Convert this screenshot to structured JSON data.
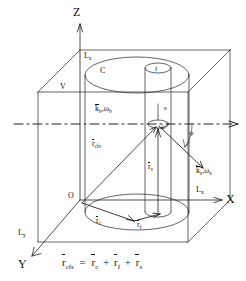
{
  "diagram": {
    "title_equation": {
      "lhs_symbol": "r",
      "lhs_sub": "cfs",
      "equals": "=",
      "term1_symbol": "r",
      "term1_sub": "c",
      "plus1": "+",
      "term2_symbol": "r",
      "term2_sub": "f",
      "plus2": "+",
      "term3_symbol": "r",
      "term3_sub": "s",
      "full_text": "r_cfs = r_c + r_f + r_s"
    },
    "axes": [
      {
        "name": "z-axis",
        "label": "Z"
      },
      {
        "name": "x-axis",
        "label": "X"
      },
      {
        "name": "y-axis",
        "label": "Y"
      }
    ],
    "dimensions": [
      {
        "name": "box-height",
        "symbol": "L",
        "sub": "z"
      },
      {
        "name": "box-width-x",
        "symbol": "L",
        "sub": "x"
      },
      {
        "name": "box-depth-y",
        "symbol": "L",
        "sub": "y"
      }
    ],
    "regions": [
      {
        "name": "volume",
        "label": "V"
      },
      {
        "name": "large-cylinder",
        "label": "C"
      },
      {
        "name": "small-cylinder",
        "label": "f"
      },
      {
        "name": "scatterer",
        "label": "s"
      },
      {
        "name": "origin",
        "label": "O"
      }
    ],
    "vectors": [
      {
        "name": "r-cfs",
        "symbol": "r",
        "sub": "cfs"
      },
      {
        "name": "r-s",
        "symbol": "r",
        "sub": "s"
      },
      {
        "name": "r-c",
        "symbol": "r",
        "sub": "c"
      },
      {
        "name": "r-f",
        "symbol": "r",
        "sub": "f"
      }
    ],
    "waves": [
      {
        "name": "incident-wave",
        "k_symbol": "k",
        "k_sub": "b",
        "omega_symbol": "ω",
        "omega_sub": "b",
        "comma": ","
      },
      {
        "name": "scattered-wave",
        "k_symbol": "k",
        "k_sub": "s",
        "omega_symbol": "ω",
        "omega_sub": "s",
        "comma": ","
      }
    ],
    "angle": {
      "name": "scattering-angle",
      "label": "ψ"
    },
    "colors": {
      "ink": "#1a1a1a",
      "background": "#ffffff"
    }
  }
}
